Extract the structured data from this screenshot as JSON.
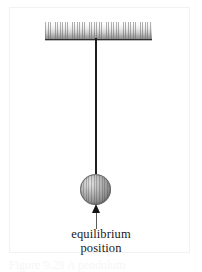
{
  "figure": {
    "type": "physics-diagram",
    "background_color": "#ffffff",
    "frame_color": "#f2f2f2"
  },
  "support": {
    "name": "ceiling-support-bar",
    "surface_style": "hatched",
    "edge_color": "#2e2e2e",
    "fill_top_color": "#ffffff",
    "fill_bottom_color": "#8f8f8f"
  },
  "string": {
    "name": "pendulum-string",
    "color": "#1d1d1d"
  },
  "bob": {
    "name": "pendulum-bob",
    "shape": "sphere",
    "highlight_color": "#e2e2e2",
    "shadow_color": "#5d5d5d",
    "outline_color": "#6d6d6d"
  },
  "arrow": {
    "name": "equilibrium-indicator-arrow",
    "direction": "up",
    "shaft_color": "#5a5a5a",
    "head_color": "#141414"
  },
  "labels": {
    "equilibrium_line1": "equilibrium",
    "equilibrium_line2": "position"
  },
  "caption": {
    "text": "Figure 9.29 A pendulum"
  }
}
